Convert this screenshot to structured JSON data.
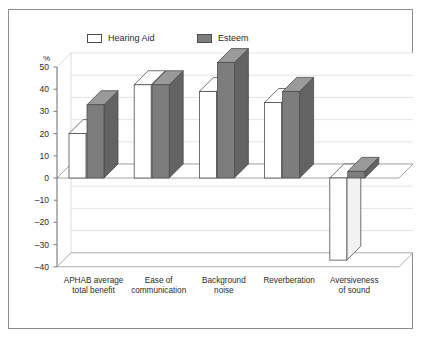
{
  "chart_data": {
    "type": "bar",
    "title": "",
    "subtitle": "",
    "xlabel": "",
    "ylabel": "%",
    "ylim": [
      -40,
      50
    ],
    "ytick_values": [
      50,
      40,
      30,
      20,
      10,
      0,
      -10,
      -20,
      -30,
      -40
    ],
    "ytick_labels": [
      "50",
      "40",
      "30",
      "20",
      "10",
      "0",
      "–10",
      "–20",
      "–30",
      "–40"
    ],
    "grid": true,
    "legend_position": "top",
    "three_d": true,
    "categories": [
      "APHAB average total benefit",
      "Ease of communication",
      "Background noise",
      "Reverberation",
      "Aversiveness of sound"
    ],
    "category_lines": [
      [
        "APHAB average",
        "total benefit"
      ],
      [
        "Ease of",
        "communication"
      ],
      [
        "Background",
        "noise"
      ],
      [
        "Reverberation",
        ""
      ],
      [
        "Aversiveness",
        "of sound"
      ]
    ],
    "series": [
      {
        "name": "Hearing Aid",
        "color": "#ffffff",
        "values": [
          20,
          42,
          39,
          34,
          -37
        ]
      },
      {
        "name": "Esteem",
        "color": "#7d7d7d",
        "values": [
          33,
          42,
          52,
          39,
          3
        ]
      }
    ]
  },
  "legend": {
    "items": [
      {
        "label": "Hearing Aid",
        "swatch": "white"
      },
      {
        "label": "Esteem",
        "swatch": "gray"
      }
    ]
  },
  "axis": {
    "unit_label": "%"
  },
  "colors": {
    "border": "#8c8c8c",
    "bar_outline": "#4d4d4d",
    "bar_fill_esteem": "#7d7d7d",
    "bar_fill_hearing_aid": "#ffffff",
    "grid": "#d9d9d9",
    "axis": "#6e6e6e",
    "text": "#2b2b2b",
    "background": "#ffffff"
  }
}
